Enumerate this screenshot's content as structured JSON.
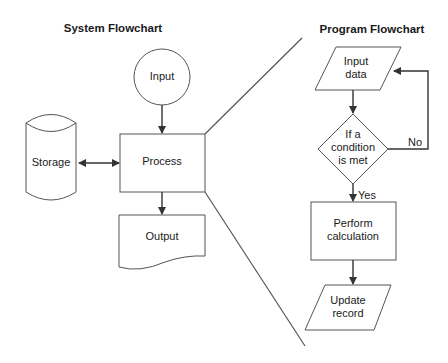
{
  "system": {
    "title": "System Flowchart",
    "nodes": {
      "input": "Input",
      "process": "Process",
      "storage": "Storage",
      "output": "Output"
    }
  },
  "program": {
    "title": "Program Flowchart",
    "nodes": {
      "input_line1": "Input",
      "input_line2": "data",
      "decision_line1": "If a",
      "decision_line2": "condition",
      "decision_line3": "is met",
      "calc_line1": "Perform",
      "calc_line2": "calculation",
      "update_line1": "Update",
      "update_line2": "record"
    },
    "edges": {
      "yes": "Yes",
      "no": "No"
    }
  }
}
